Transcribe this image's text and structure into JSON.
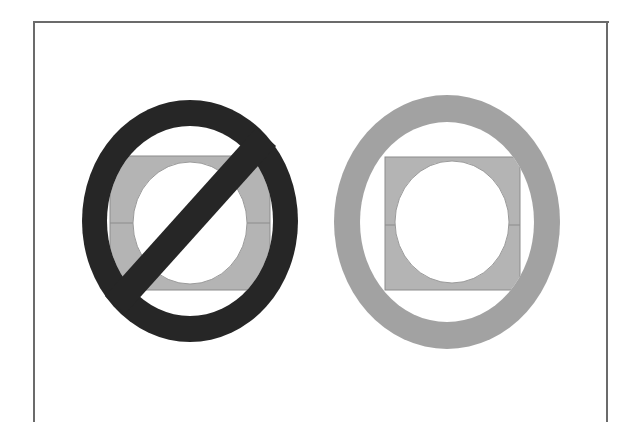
{
  "page": {
    "background_color": "#ffffff",
    "width": 623,
    "height": 422,
    "frame": {
      "color": "#6b6b6b",
      "thickness": 2,
      "left": 33,
      "top": 21,
      "right": 607,
      "sides_visible": "top, left, right"
    }
  },
  "figure": {
    "type": "pictogram-pair",
    "symbols": [
      {
        "id": "prohibited",
        "label": "prohibition-symbol-with-slash",
        "position": {
          "cx": 190,
          "cy": 221,
          "rx": 108,
          "ry": 121
        },
        "ring": {
          "color": "#262626",
          "outer_rx": 108,
          "outer_ry": 121,
          "inner_rx": 83,
          "inner_ry": 95
        },
        "slash": {
          "present": true,
          "color": "#262626",
          "width": 27,
          "direction": "upper-right to lower-left"
        },
        "plate": {
          "fill": "#b4b4b4",
          "stroke": "#8c8c8c",
          "x": 110,
          "y": 156,
          "width": 160,
          "height": 134,
          "divider_y": 223
        },
        "inner_circle": {
          "fill": "#ffffff",
          "stroke": "#9a9a9a",
          "cx": 190,
          "cy": 223,
          "rx": 57,
          "ry": 61
        }
      },
      {
        "id": "allowed",
        "label": "plain-circle-symbol",
        "position": {
          "cx": 447,
          "cy": 222,
          "rx": 113,
          "ry": 127
        },
        "ring": {
          "color": "#a2a2a2",
          "outer_rx": 113,
          "outer_ry": 127,
          "inner_rx": 87,
          "inner_ry": 100
        },
        "slash": {
          "present": false,
          "color": "",
          "width": 0,
          "direction": ""
        },
        "plate": {
          "fill": "#b4b4b4",
          "stroke": "#8c8c8c",
          "x": 385,
          "y": 157,
          "width": 135,
          "height": 133,
          "divider_y": 225
        },
        "inner_circle": {
          "fill": "#ffffff",
          "stroke": "#9a9a9a",
          "cx": 452,
          "cy": 222,
          "rx": 57,
          "ry": 61
        }
      }
    ]
  },
  "colors": {
    "ring_dark": "#262626",
    "ring_gray": "#a2a2a2",
    "plate_gray": "#b4b4b4",
    "plate_outline": "#8c8c8c",
    "white": "#ffffff",
    "frame": "#6b6b6b"
  }
}
